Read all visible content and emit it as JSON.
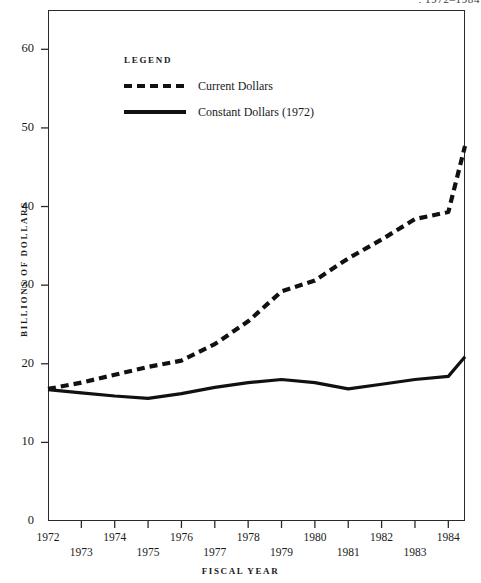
{
  "title_remnant": ", 1972–1984",
  "axes": {
    "ylabel": "BILLIONS OF DOLLARS",
    "xlabel": "FISCAL YEAR",
    "yticks": [
      "0",
      "10",
      "20",
      "30",
      "40",
      "50",
      "60"
    ],
    "xticks": [
      "1972",
      "1973",
      "1974",
      "1975",
      "1976",
      "1977",
      "1978",
      "1979",
      "1980",
      "1981",
      "1982",
      "1983",
      "1984"
    ]
  },
  "legend": {
    "title": "LEGEND",
    "entries": [
      {
        "label": "Current Dollars",
        "style": "dashed",
        "color": "#111111"
      },
      {
        "label": "Constant Dollars (1972)",
        "style": "solid",
        "color": "#111111"
      }
    ]
  },
  "chart_data": {
    "type": "line",
    "title": ", 1972–1984",
    "xlabel": "FISCAL YEAR",
    "ylabel": "BILLIONS OF DOLLARS",
    "x": [
      1972,
      1973,
      1974,
      1975,
      1976,
      1977,
      1978,
      1979,
      1980,
      1981,
      1982,
      1983,
      1984,
      1984.5
    ],
    "xlim": [
      1972,
      1984.5
    ],
    "ylim": [
      0,
      65
    ],
    "yticks": [
      0,
      10,
      20,
      30,
      40,
      50,
      60
    ],
    "grid": false,
    "legend_position": "upper-left-inside",
    "series": [
      {
        "name": "Current Dollars",
        "style": "dashed",
        "color": "#111111",
        "values": [
          16.8,
          17.6,
          18.6,
          19.6,
          20.4,
          22.5,
          25.4,
          29.2,
          30.6,
          33.4,
          35.8,
          38.4,
          39.3,
          47.7
        ]
      },
      {
        "name": "Constant Dollars (1972)",
        "style": "solid",
        "color": "#111111",
        "values": [
          16.7,
          16.3,
          15.9,
          15.6,
          16.2,
          17.0,
          17.6,
          18.0,
          17.6,
          16.8,
          17.4,
          18.0,
          18.4,
          20.9
        ]
      }
    ]
  }
}
